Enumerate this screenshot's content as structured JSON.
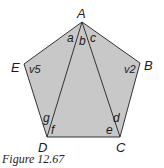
{
  "figure": {
    "caption": "Figure 12.67",
    "fill_color": "#c8c8c8",
    "stroke_color": "#333333",
    "vertices": [
      {
        "name": "A",
        "x": 82,
        "y": 22
      },
      {
        "name": "B",
        "x": 140,
        "y": 63
      },
      {
        "name": "C",
        "x": 120,
        "y": 137
      },
      {
        "name": "D",
        "x": 47,
        "y": 137
      },
      {
        "name": "E",
        "x": 24,
        "y": 64
      }
    ],
    "vertex_labels": {
      "A": "A",
      "B": "B",
      "C": "C",
      "D": "D",
      "E": "E"
    },
    "angle_labels": {
      "a": "a",
      "b": "b",
      "c": "c",
      "d": "d",
      "e": "e",
      "f": "f",
      "g": "g",
      "v2": "v2",
      "v5": "v5"
    },
    "diagonals": [
      [
        "A",
        "D"
      ],
      [
        "A",
        "C"
      ]
    ]
  }
}
